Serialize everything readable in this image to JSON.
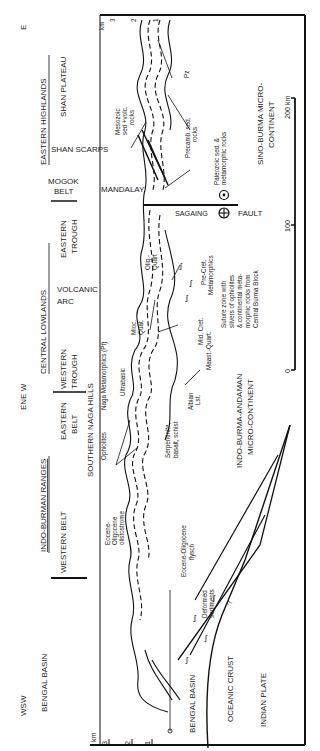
{
  "orientation": "rotated-90-ccw",
  "directions": {
    "west": "WSW",
    "center": "ENE W",
    "east": "E"
  },
  "regions": {
    "bengal_basin": "BENGAL BASIN",
    "indo_burman_ranges": "INDO-BURMAN RANGES",
    "western_belt": "WESTERN BELT",
    "eastern_belt_1": "EASTERN",
    "eastern_belt_2": "BELT",
    "central_lowlands": "CENTRAL LOWLANDS",
    "western_trough_1": "WESTERN",
    "western_trough_2": "TROUGH",
    "volcanic_arc_1": "VOLCANIC",
    "volcanic_arc_2": "ARC",
    "eastern_trough_1": "EASTERN",
    "eastern_trough_2": "TROUGH",
    "mogok_belt_1": "MOGOK",
    "mogok_belt_2": "BELT",
    "eastern_highlands": "EASTERN HIGHLANDS",
    "shan_scarps": "SHAN SCARPS",
    "shan_plateau": "SHAN PLATEAU"
  },
  "features": {
    "southern_naga_hills": "SOUTHERN NAGA HILLS",
    "mandalay": "MANDALAY",
    "sagaing": "SAGAING",
    "fault": "FAULT"
  },
  "rock_labels": {
    "eo_olisto_1": "Eocene-",
    "eo_olisto_2": "Oligocene",
    "eo_olisto_3": "olistostrome",
    "eo_flysch_1": "Eocene-Oligocene",
    "eo_flysch_2": "flysch",
    "deformed_1": "Deformed",
    "deformed_2": "sediments",
    "ophiolites": "Ophiolites",
    "naga_meta": "Naga Metamorphics  (Pt)",
    "ultrabasic": "Ultrabasic",
    "serp_1": "Serpentinite,",
    "serp_2": "basalt, schist",
    "albian_1": "Albian",
    "albian_2": "Lst.",
    "mioc_1": "Mioc.",
    "mioc_2": "Quat.",
    "midcret": "Mid. Cret.",
    "maast": "Maast.-Quart.",
    "olig_1": "Olig.-",
    "olig_2": "Quart",
    "precret_1": "Pre-Cret.",
    "precret_2": "Metamorphics",
    "mesozoic_1": "Mesozoic",
    "mesozoic_2": "sed +volc.",
    "mesozoic_3": "rocks",
    "precamb_1": "Precamb. sed.",
    "precamb_2": "rocks",
    "paleozoic_1": "Paleozoic sed. &",
    "paleozoic_2": "metamorphic rocks",
    "pz": "Pz",
    "suture_1": "Suture zone with",
    "suture_2": "slivers of ophiolites",
    "suture_3": "& continental meta-",
    "suture_4": "morphic rocks from",
    "suture_5": "Central Burma Block"
  },
  "crust_labels": {
    "bengal_basin_lower": "BENGAL BASIN",
    "oceanic_crust": "OCEANIC CRUST",
    "indian_plate": "INDIAN PLATE",
    "indo_burma_1": "INDO-BURMA-ANDAMAN",
    "indo_burma_2": "MICRO-CONTINENT",
    "sino_burma_1": "SINO-BURMA MICRO-",
    "sino_burma_2": "CONTINENT"
  },
  "vertical_scale": {
    "unit": "km",
    "ticks": [
      "3",
      "2",
      "1",
      "0"
    ]
  },
  "horizontal_scale": {
    "ticks": [
      "0",
      "100",
      "200 km"
    ]
  },
  "uncertain_mark": "?"
}
